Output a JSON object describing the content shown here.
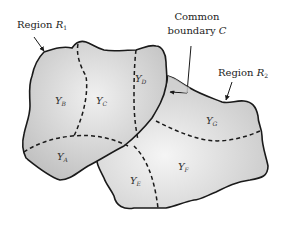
{
  "diagram": {
    "type": "region-partition",
    "regions": [
      {
        "id": "R1",
        "label_prefix": "Region ",
        "label_symbol": "R",
        "label_sub": "1",
        "fill": "#c8c8c8",
        "subregions": [
          "A",
          "B",
          "C",
          "D"
        ]
      },
      {
        "id": "R2",
        "label_prefix": "Region ",
        "label_symbol": "R",
        "label_sub": "2",
        "fill": "#d2d2d2",
        "subregions": [
          "E",
          "F",
          "G"
        ]
      }
    ],
    "common_boundary": {
      "line1": "Common",
      "line2_prefix": "boundary ",
      "line2_symbol": "C"
    },
    "subregion_labels": [
      {
        "id": "A",
        "symbol": "Y",
        "sub": "A"
      },
      {
        "id": "B",
        "symbol": "Y",
        "sub": "B"
      },
      {
        "id": "C",
        "symbol": "Y",
        "sub": "C"
      },
      {
        "id": "D",
        "symbol": "Y",
        "sub": "D"
      },
      {
        "id": "E",
        "symbol": "Y",
        "sub": "E"
      },
      {
        "id": "F",
        "symbol": "Y",
        "sub": "F"
      },
      {
        "id": "G",
        "symbol": "Y",
        "sub": "G"
      }
    ],
    "colors": {
      "outline": "#1a1a1a",
      "dashed": "#1a1a1a",
      "background": "#ffffff"
    }
  }
}
